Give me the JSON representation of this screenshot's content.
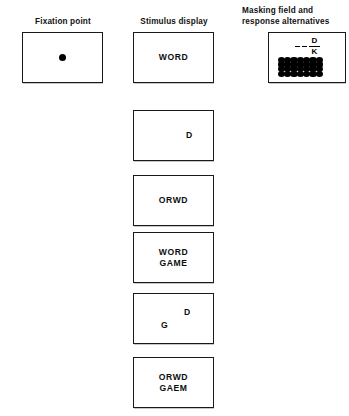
{
  "figure": {
    "title_columns": {
      "fixation": "Fixation point",
      "stimulus": "Stimulus display",
      "masking": "Masking field and\nresponse alternatives"
    }
  },
  "fixation_panel": {
    "header": "Fixation point",
    "dot_label": "fixation-dot"
  },
  "stimulus_panel": {
    "header": "Stimulus display",
    "displays": [
      {
        "id": "word",
        "kind": "centered",
        "text": "WORD"
      },
      {
        "id": "single-d",
        "kind": "free",
        "letters": [
          {
            "char": "D",
            "pos": "right-of-center"
          }
        ]
      },
      {
        "id": "orwd",
        "kind": "centered",
        "text": "ORWD"
      },
      {
        "id": "word-game",
        "kind": "centered",
        "text": "WORD\nGAME"
      },
      {
        "id": "d-g",
        "kind": "free",
        "letters": [
          {
            "char": "D",
            "pos": "upper-right"
          },
          {
            "char": "G",
            "pos": "lower-left"
          }
        ]
      },
      {
        "id": "orwd-gaem",
        "kind": "centered",
        "text": "ORWD\nGAEM"
      }
    ]
  },
  "masking_panel": {
    "header": "Masking field and\nresponse alternatives",
    "response_alternatives": {
      "dash_count": 2,
      "upper_letter": "D",
      "lower_letter": "K"
    },
    "mask": {
      "columns": 7,
      "rows": 4,
      "dot_color": "#000000"
    }
  },
  "colors": {
    "ink": "#000000",
    "box_border": "#1a1a1a",
    "background": "#ffffff"
  }
}
